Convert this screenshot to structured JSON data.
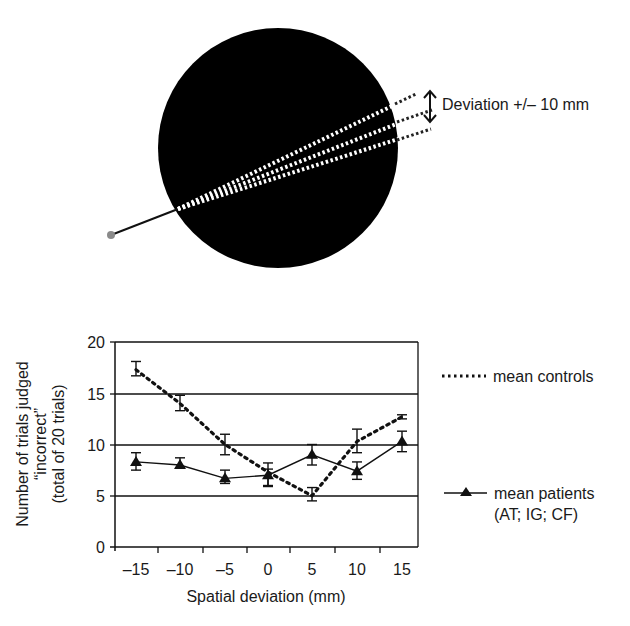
{
  "diagram": {
    "deviation_label": "Deviation +/– 10 mm",
    "circle_color": "#000000",
    "pointer_dot_color": "#8a8a8a"
  },
  "legend": {
    "controls_label": "mean controls",
    "patients_label_line1": "mean patients",
    "patients_label_line2": "(AT; IG; CF)"
  },
  "axes": {
    "ylabel_line1": "Number of trials judged",
    "ylabel_line2": "“incorrect”",
    "ylabel_line3": "(total of 20 trials)",
    "xlabel": "Spatial deviation (mm)",
    "yticks": [
      "0",
      "5",
      "10",
      "15",
      "20"
    ],
    "xticks": [
      "–15",
      "–10",
      "–5",
      "0",
      "5",
      "10",
      "15"
    ]
  },
  "chart_data": {
    "type": "line",
    "title": "",
    "xlabel": "Spatial deviation (mm)",
    "ylabel": "Number of trials judged “incorrect” (total of 20 trials)",
    "x": [
      -15,
      -10,
      -5,
      0,
      5,
      10,
      15
    ],
    "ylim": [
      0,
      20
    ],
    "grid": "horizontal at 5, 10, 15, 20",
    "legend_position": "right",
    "series": [
      {
        "name": "mean controls",
        "style": "dotted",
        "values": [
          17.3,
          14.0,
          10.0,
          7.3,
          5.0,
          10.3,
          12.7
        ],
        "error_low": [
          16.7,
          13.3,
          9.0,
          6.0,
          4.5,
          9.2,
          12.5
        ],
        "error_high": [
          18.1,
          14.8,
          11.0,
          8.2,
          5.8,
          11.5,
          12.9
        ]
      },
      {
        "name": "mean patients (AT; IG; CF)",
        "style": "solid with triangle markers",
        "values": [
          8.3,
          8.0,
          6.7,
          7.0,
          9.0,
          7.4,
          10.3
        ],
        "error_low": [
          7.5,
          7.7,
          6.2,
          5.9,
          8.0,
          6.6,
          9.3
        ],
        "error_high": [
          9.2,
          8.7,
          7.5,
          7.6,
          10.0,
          8.3,
          11.3
        ]
      }
    ]
  }
}
